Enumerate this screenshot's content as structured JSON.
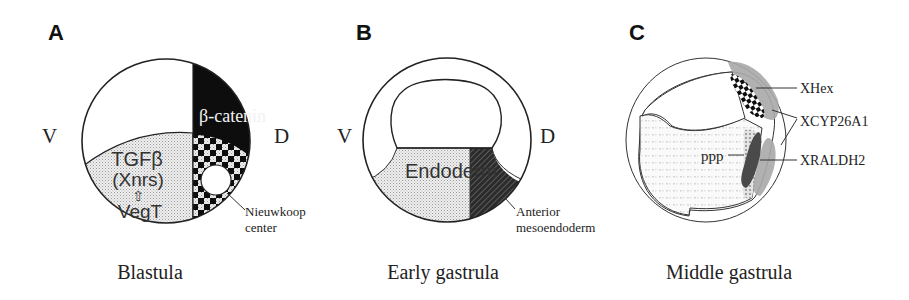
{
  "figure": {
    "panels": [
      {
        "letter": "A",
        "caption": "Blastula",
        "ventral_label": "V",
        "dorsal_label": "D",
        "regions": {
          "beta_catenin": "β-catenin",
          "tgfb_line1": "TGFβ",
          "tgfb_line2": "(Xnrs)",
          "arrow_glyph": "⇧",
          "vegt": "VegT"
        },
        "callout": {
          "line1": "Nieuwkoop",
          "line2": "center"
        }
      },
      {
        "letter": "B",
        "caption": "Early gastrula",
        "ventral_label": "V",
        "dorsal_label": "D",
        "regions": {
          "endoderm": "Endoderm"
        },
        "callout": {
          "line1": "Anterior",
          "line2": "mesoendoderm"
        }
      },
      {
        "letter": "C",
        "caption": "Middle gastrula",
        "genes": [
          "XHex",
          "XCYP26A1",
          "XRALDH2"
        ],
        "region_label": "ppp"
      }
    ],
    "colors": {
      "outline": "#222222",
      "black_region": "#0d0d0d",
      "stipple_light": "#e6e6e6",
      "gray_domain": "#a9a9a9",
      "dark_domain": "#4a4a4a"
    }
  }
}
